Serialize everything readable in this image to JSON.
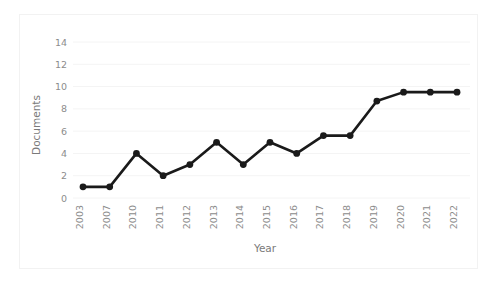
{
  "chart_data": {
    "type": "line",
    "title": "",
    "xlabel": "Year",
    "ylabel": "Documents",
    "categories": [
      "2003",
      "2007",
      "2010",
      "2011",
      "2012",
      "2013",
      "2014",
      "2015",
      "2016",
      "2017",
      "2018",
      "2019",
      "2020",
      "2021",
      "2022"
    ],
    "values": [
      1,
      1,
      4,
      2,
      3,
      5,
      3,
      5,
      4,
      5.6,
      5.6,
      8.7,
      9.5,
      9.5,
      9.5
    ],
    "series": [
      {
        "name": "Documents",
        "values": [
          1,
          1,
          4,
          2,
          3,
          5,
          3,
          5,
          4,
          5.6,
          5.6,
          8.7,
          9.5,
          9.5,
          9.5
        ]
      }
    ],
    "ylim": [
      0,
      15
    ],
    "yticks": [
      0,
      2,
      4,
      6,
      8,
      10,
      12,
      14
    ],
    "ytick_labels": [
      "0",
      "2",
      "4",
      "6",
      "8",
      "10",
      "12",
      "14"
    ],
    "grid": true,
    "grid_axis": "y",
    "legend": "none",
    "marker": "circle",
    "line_color": "#1a1a1a",
    "marker_color": "#1a1a1a",
    "grid_color": "#f4f4f4",
    "tick_label_color": "#8c8c8c",
    "axis_title_color": "#7a7a7a",
    "background_color": "#ffffff",
    "frame_color": "#f2f2f2",
    "xtick_rotation": -90
  },
  "figure": {
    "width": 503,
    "height": 289
  }
}
